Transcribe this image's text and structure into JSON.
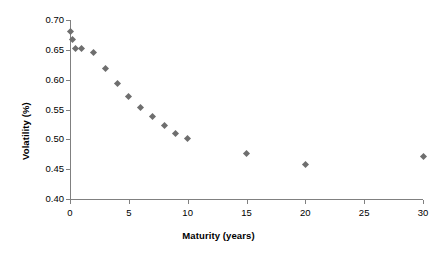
{
  "chart_data": {
    "type": "scatter",
    "title": "",
    "xlabel": "Maturity (years)",
    "ylabel": "Volatility (%)",
    "xlim": [
      0,
      30
    ],
    "ylim": [
      0.4,
      0.7
    ],
    "xticks": [
      "0",
      "5",
      "10",
      "15",
      "20",
      "25",
      "30"
    ],
    "xtick_values": [
      0,
      5,
      10,
      15,
      20,
      25,
      30
    ],
    "yticks": [
      "0.40",
      "0.45",
      "0.50",
      "0.55",
      "0.60",
      "0.65",
      "0.70"
    ],
    "ytick_values": [
      0.4,
      0.45,
      0.5,
      0.55,
      0.6,
      0.65,
      0.7
    ],
    "grid": false,
    "legend": false,
    "marker_shape": "diamond",
    "marker_color": "#6e6e6e",
    "axis_color": "#808080",
    "x": [
      0,
      0.25,
      0.5,
      1,
      2,
      3,
      4,
      5,
      6,
      7,
      8,
      9,
      10,
      15,
      20,
      30
    ],
    "y": [
      0.68,
      0.667,
      0.652,
      0.653,
      0.645,
      0.619,
      0.594,
      0.571,
      0.554,
      0.539,
      0.523,
      0.509,
      0.502,
      0.476,
      0.457,
      0.471
    ],
    "points": [
      {
        "x": 0,
        "y": 0.68
      },
      {
        "x": 0.25,
        "y": 0.667
      },
      {
        "x": 0.5,
        "y": 0.652
      },
      {
        "x": 1,
        "y": 0.653
      },
      {
        "x": 2,
        "y": 0.645
      },
      {
        "x": 3,
        "y": 0.619
      },
      {
        "x": 4,
        "y": 0.594
      },
      {
        "x": 5,
        "y": 0.571
      },
      {
        "x": 6,
        "y": 0.554
      },
      {
        "x": 7,
        "y": 0.539
      },
      {
        "x": 8,
        "y": 0.523
      },
      {
        "x": 9,
        "y": 0.509
      },
      {
        "x": 10,
        "y": 0.502
      },
      {
        "x": 15,
        "y": 0.476
      },
      {
        "x": 20,
        "y": 0.457
      },
      {
        "x": 30,
        "y": 0.471
      }
    ]
  }
}
